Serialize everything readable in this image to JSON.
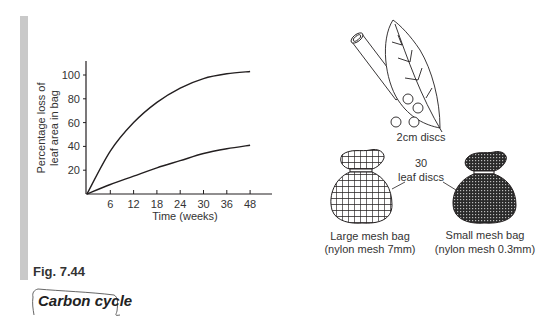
{
  "figure": {
    "label": "Fig. 7.44",
    "section_tag": "Carbon cycle"
  },
  "chart_data": {
    "type": "line",
    "title": "",
    "xlabel": "Time (weeks)",
    "ylabel": "Percentage loss of leaf area in bag",
    "ylabel_lines": [
      "Percentage loss of",
      "leaf area in bag"
    ],
    "x_ticks": [
      "6",
      "12",
      "18",
      "24",
      "30",
      "36",
      "48"
    ],
    "y_ticks": [
      "20",
      "40",
      "60",
      "80",
      "100"
    ],
    "ylim": [
      0,
      110
    ],
    "grid": false,
    "legend": "none",
    "x": [
      0,
      6,
      12,
      18,
      24,
      30,
      36,
      48
    ],
    "series": [
      {
        "name": "Large mesh bag (nylon mesh 7mm)",
        "values": [
          0,
          36,
          60,
          77,
          89,
          97,
          101,
          103
        ]
      },
      {
        "name": "Small mesh bag (nylon mesh 0.3mm)",
        "values": [
          0,
          8,
          15,
          22,
          28,
          34,
          38,
          41
        ]
      }
    ],
    "x_tick_positions_note": "ticks evenly spaced; last tick labelled 48"
  },
  "illustration": {
    "discs_label": "2cm discs",
    "count_label": "30",
    "count_sub_label": "leaf discs",
    "large_bag": {
      "title": "Large mesh bag",
      "detail": "(nylon mesh 7mm)"
    },
    "small_bag": {
      "title": "Small mesh bag",
      "detail": "(nylon mesh 0.3mm)"
    }
  }
}
